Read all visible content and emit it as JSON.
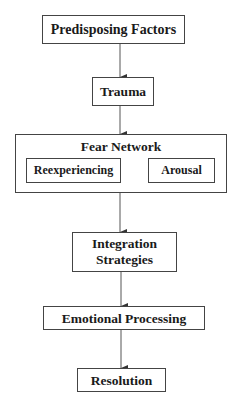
{
  "diagram": {
    "type": "flowchart",
    "direction": "top-to-bottom",
    "nodes": [
      {
        "id": "predisposing",
        "label": "Predisposing Factors"
      },
      {
        "id": "trauma",
        "label": "Trauma"
      },
      {
        "id": "fear_network",
        "label": "Fear Network",
        "children": [
          {
            "id": "reexperiencing",
            "label": "Reexperiencing"
          },
          {
            "id": "arousal",
            "label": "Arousal"
          }
        ]
      },
      {
        "id": "integration",
        "label": "Integration Strategies",
        "lines": [
          "Integration",
          "Strategies"
        ]
      },
      {
        "id": "emotional",
        "label": "Emotional Processing"
      },
      {
        "id": "resolution",
        "label": "Resolution"
      }
    ],
    "edges": [
      {
        "from": "predisposing",
        "to": "trauma"
      },
      {
        "from": "trauma",
        "to": "fear_network"
      },
      {
        "from": "fear_network",
        "to": "integration"
      },
      {
        "from": "integration",
        "to": "emotional"
      },
      {
        "from": "emotional",
        "to": "resolution"
      }
    ]
  },
  "labels": {
    "predisposing": "Predisposing Factors",
    "trauma": "Trauma",
    "fear_network": "Fear Network",
    "reexperiencing": "Reexperiencing",
    "arousal": "Arousal",
    "integration_line1": "Integration",
    "integration_line2": "Strategies",
    "emotional": "Emotional Processing",
    "resolution": "Resolution"
  },
  "colors": {
    "line": "#444444",
    "text": "#1a1a1a",
    "background": "#ffffff"
  }
}
